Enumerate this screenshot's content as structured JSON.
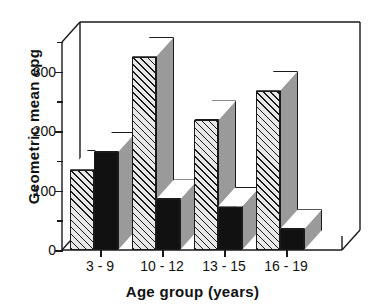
{
  "chart_data": {
    "type": "bar",
    "title": "",
    "xlabel": "Age group (years)",
    "ylabel": "Geometric mean epg",
    "categories": [
      "3 - 9",
      "10 - 12",
      "13 - 15",
      "16 - 19"
    ],
    "series": [
      {
        "name": "series-hatched",
        "fill": "hatched",
        "values": [
          135,
          325,
          218,
          268
        ]
      },
      {
        "name": "series-black",
        "fill": "solid-black",
        "values": [
          165,
          85,
          73,
          35
        ]
      }
    ],
    "ylim": [
      0,
      350
    ],
    "yticks": [
      0,
      100,
      200,
      300
    ],
    "ytick_labels": [
      "0",
      "100",
      "200",
      "300"
    ],
    "yminor_ticks": [
      50,
      150,
      250,
      350
    ],
    "grid": false,
    "legend": "none",
    "style": "3d-bar",
    "colors": {
      "outline": "#1a1a1a",
      "hatch": "#1a1a1a",
      "hatch_bg": "#e8e8e8",
      "solid": "#111111",
      "bar_side": "#9a9a9a",
      "bar_top": "#ffffff",
      "background": "#ffffff"
    }
  }
}
